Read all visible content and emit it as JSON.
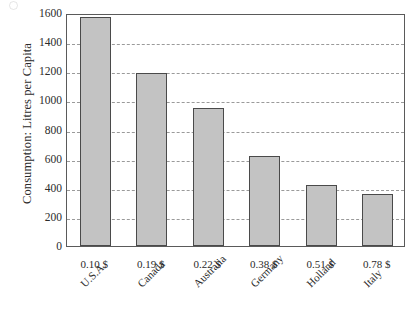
{
  "chart_data": {
    "type": "bar",
    "title": "",
    "xlabel": "",
    "ylabel": "Consumption: Litres per Capita",
    "ylim": [
      0,
      1600
    ],
    "ytick_step": 200,
    "grid": true,
    "legend": "none",
    "orientation": "vertical",
    "categories": [
      "U.S.A.",
      "Canada",
      "Australia",
      "Germany",
      "Holland",
      "Italy"
    ],
    "values": [
      1570,
      1185,
      945,
      620,
      420,
      360
    ],
    "secondary_tick_labels": [
      "0.10 $",
      "0.19 $",
      "0.22 $",
      "0.38 $",
      "0.51 $",
      "0.78 $"
    ],
    "ytick_labels": [
      "0",
      "200",
      "400",
      "600",
      "800",
      "1000",
      "1200",
      "1400",
      "1600"
    ],
    "ytick_values": [
      0,
      200,
      400,
      600,
      800,
      1000,
      1200,
      1400,
      1600
    ],
    "points": [
      {
        "category": "U.S.A.",
        "price": "0.10 $",
        "value": 1570
      },
      {
        "category": "Canada",
        "price": "0.19 $",
        "value": 1185
      },
      {
        "category": "Australia",
        "price": "0.22 $",
        "value": 945
      },
      {
        "category": "Germany",
        "price": "0.38 $",
        "value": 620
      },
      {
        "category": "Holland",
        "price": "0.51 $",
        "value": 420
      },
      {
        "category": "Italy",
        "price": "0.78 $",
        "value": 360
      }
    ],
    "colors": {
      "bar_fill": "#c3c3c3",
      "bar_border": "#4a4a4a",
      "gridline": "#9a9a9a",
      "frame": "#5a5a5a",
      "text": "#2b2b2b",
      "background": "#ffffff"
    }
  }
}
